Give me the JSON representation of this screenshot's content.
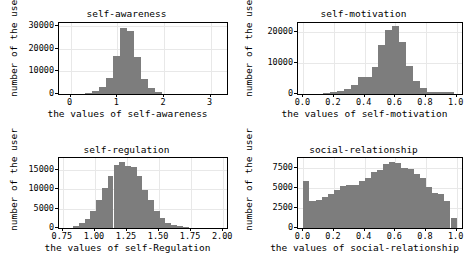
{
  "figure": {
    "layout": "2x2 grid of histograms",
    "background_color": "#ffffff",
    "bar_color": "#7d7d7d",
    "grid_color": "#e8e8e8",
    "axis_color": "#000000"
  },
  "chart_data": [
    {
      "type": "bar",
      "id": "self-awareness",
      "title": "self-awareness",
      "xlabel": "the values of self-awareness",
      "ylabel": "number of the user",
      "xlim": [
        -0.25,
        3.35
      ],
      "ylim": [
        0,
        31500
      ],
      "xticks": [
        0,
        1,
        2,
        3
      ],
      "xtick_labels": [
        "0",
        "1",
        "2",
        "3"
      ],
      "yticks": [
        0,
        10000,
        20000,
        30000
      ],
      "ytick_labels": [
        "0",
        "10000",
        "20000",
        "30000"
      ],
      "grid": true,
      "bin_edges": [
        0.3,
        0.45,
        0.6,
        0.75,
        0.9,
        1.05,
        1.2,
        1.35,
        1.5,
        1.65,
        1.8,
        1.95
      ],
      "values": [
        400,
        1400,
        3000,
        6900,
        16800,
        29200,
        27800,
        16600,
        6600,
        2600,
        900
      ]
    },
    {
      "type": "bar",
      "id": "self-motivation",
      "title": "self-motivation",
      "xlabel": "the values of self-motivation",
      "ylabel": "number of the user",
      "xlim": [
        -0.035,
        1.035
      ],
      "ylim": [
        0,
        23000
      ],
      "xticks": [
        0.0,
        0.2,
        0.4,
        0.6,
        0.8,
        1.0
      ],
      "xtick_labels": [
        "0.0",
        "0.2",
        "0.4",
        "0.6",
        "0.8",
        "1.0"
      ],
      "yticks": [
        0,
        10000,
        20000
      ],
      "ytick_labels": [
        "0",
        "10000",
        "20000"
      ],
      "grid": true,
      "bin_edges": [
        0.13,
        0.175,
        0.22,
        0.265,
        0.31,
        0.355,
        0.4,
        0.445,
        0.49,
        0.535,
        0.58,
        0.625,
        0.67,
        0.715,
        0.76,
        0.805,
        0.85,
        0.895,
        0.94,
        0.985
      ],
      "values": [
        250,
        500,
        900,
        1700,
        3000,
        5600,
        5500,
        8900,
        16000,
        20700,
        22000,
        17000,
        9000,
        4100,
        2000,
        800,
        700,
        700,
        800
      ]
    },
    {
      "type": "bar",
      "id": "self-regulation",
      "title": "self-regulation",
      "xlabel": "the values of self-Regulation",
      "ylabel": "number of the user",
      "xlim": [
        0.72,
        2.03
      ],
      "ylim": [
        0,
        18000
      ],
      "xticks": [
        0.75,
        1.0,
        1.25,
        1.5,
        1.75,
        2.0
      ],
      "xtick_labels": [
        "0.75",
        "1.00",
        "1.25",
        "1.50",
        "1.75",
        "2.00"
      ],
      "yticks": [
        0,
        5000,
        10000,
        15000
      ],
      "ytick_labels": [
        "0",
        "5000",
        "10000",
        "15000"
      ],
      "grid": true,
      "bin_edges": [
        0.83,
        0.875,
        0.92,
        0.965,
        1.01,
        1.055,
        1.1,
        1.145,
        1.19,
        1.235,
        1.28,
        1.325,
        1.37,
        1.415,
        1.46,
        1.505,
        1.55,
        1.595,
        1.64,
        1.685,
        1.73
      ],
      "values": [
        500,
        1200,
        2400,
        4300,
        7100,
        10400,
        13500,
        16200,
        17000,
        16000,
        15600,
        13300,
        9700,
        7100,
        4300,
        2600,
        1300,
        700,
        400,
        200
      ]
    },
    {
      "type": "bar",
      "id": "social-relationship",
      "title": "social-relationship",
      "xlabel": "the values of social-relationship",
      "ylabel": "number of the user",
      "xlim": [
        -0.035,
        1.035
      ],
      "ylim": [
        0,
        8700
      ],
      "xticks": [
        0.0,
        0.2,
        0.4,
        0.6,
        0.8,
        1.0
      ],
      "xtick_labels": [
        "0.0",
        "0.2",
        "0.4",
        "0.6",
        "0.8",
        "1.0"
      ],
      "yticks": [
        0,
        2500,
        5000,
        7500
      ],
      "ytick_labels": [
        "0",
        "2500",
        "5000",
        "7500"
      ],
      "grid": true,
      "bin_edges": [
        0.0,
        0.04,
        0.08,
        0.12,
        0.16,
        0.2,
        0.24,
        0.28,
        0.32,
        0.36,
        0.4,
        0.44,
        0.48,
        0.52,
        0.56,
        0.6,
        0.64,
        0.68,
        0.72,
        0.76,
        0.8,
        0.84,
        0.88,
        0.92,
        0.96,
        1.0
      ],
      "values": [
        5900,
        3400,
        3500,
        3900,
        4200,
        4700,
        5200,
        5300,
        5400,
        5800,
        6200,
        6900,
        7200,
        7900,
        8200,
        8100,
        7500,
        7300,
        6700,
        6200,
        5100,
        4400,
        4200,
        3400,
        1300
      ]
    }
  ]
}
